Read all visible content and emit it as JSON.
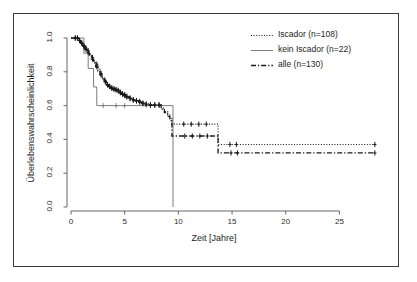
{
  "chart_data": {
    "type": "line",
    "title": "",
    "subtitle": "",
    "xlabel": "Zeit [Jahre]",
    "ylabel": "Überlebenswahrscheinlichkeit",
    "xlim": [
      0,
      28.5
    ],
    "ylim": [
      0,
      1.0
    ],
    "xticks": [
      0,
      5,
      10,
      15,
      20,
      25
    ],
    "xtick_labels": [
      "0",
      "5",
      "10",
      "15",
      "20",
      "25"
    ],
    "yticks": [
      0.0,
      0.2,
      0.4,
      0.6,
      0.8,
      1.0
    ],
    "ytick_labels": [
      "0.0",
      "0.2",
      "0.4",
      "0.6",
      "0.8",
      "1.0"
    ],
    "grid": false,
    "legend_position": "top-right",
    "plot_kind": "kaplan-meier-step",
    "series": [
      {
        "name": "Iscador (n=108)",
        "linestyle": "dotted",
        "color": "#1a1a1a",
        "steps": [
          [
            0.0,
            1.0
          ],
          [
            0.5,
            1.0
          ],
          [
            0.7,
            0.985
          ],
          [
            0.9,
            0.97
          ],
          [
            1.1,
            0.955
          ],
          [
            1.3,
            0.94
          ],
          [
            1.5,
            0.925
          ],
          [
            1.7,
            0.905
          ],
          [
            1.9,
            0.885
          ],
          [
            2.1,
            0.865
          ],
          [
            2.3,
            0.845
          ],
          [
            2.5,
            0.815
          ],
          [
            2.7,
            0.79
          ],
          [
            2.9,
            0.765
          ],
          [
            3.1,
            0.745
          ],
          [
            3.3,
            0.725
          ],
          [
            3.5,
            0.715
          ],
          [
            3.7,
            0.705
          ],
          [
            3.9,
            0.7
          ],
          [
            4.1,
            0.695
          ],
          [
            4.3,
            0.69
          ],
          [
            4.5,
            0.68
          ],
          [
            4.7,
            0.67
          ],
          [
            4.9,
            0.665
          ],
          [
            5.1,
            0.655
          ],
          [
            5.4,
            0.645
          ],
          [
            5.7,
            0.635
          ],
          [
            6.0,
            0.63
          ],
          [
            6.3,
            0.625
          ],
          [
            6.6,
            0.615
          ],
          [
            6.9,
            0.61
          ],
          [
            7.3,
            0.605
          ],
          [
            7.7,
            0.605
          ],
          [
            8.1,
            0.605
          ],
          [
            8.4,
            0.585
          ],
          [
            8.7,
            0.565
          ],
          [
            9.0,
            0.545
          ],
          [
            9.2,
            0.525
          ],
          [
            9.4,
            0.49
          ],
          [
            13.7,
            0.49
          ],
          [
            13.7,
            0.37
          ],
          [
            28.3,
            0.37
          ]
        ],
        "censor_marks_x": [
          0.4,
          0.6,
          0.8,
          1.0,
          1.2,
          1.4,
          1.6,
          2.0,
          2.4,
          2.8,
          3.2,
          3.4,
          3.6,
          3.8,
          4.0,
          4.2,
          4.4,
          4.6,
          4.8,
          5.0,
          5.2,
          5.5,
          5.8,
          6.1,
          6.4,
          6.7,
          7.0,
          7.4,
          7.8,
          8.2,
          10.5,
          11.2,
          11.9,
          12.6,
          14.8,
          15.4,
          28.3
        ]
      },
      {
        "name": "kein Iscador (n=22)",
        "linestyle": "solid",
        "color": "#6e6e6e",
        "steps": [
          [
            0.0,
            1.0
          ],
          [
            1.2,
            1.0
          ],
          [
            1.2,
            0.91
          ],
          [
            1.6,
            0.91
          ],
          [
            1.6,
            0.82
          ],
          [
            2.1,
            0.82
          ],
          [
            2.1,
            0.71
          ],
          [
            2.4,
            0.71
          ],
          [
            2.4,
            0.6
          ],
          [
            9.5,
            0.6
          ],
          [
            9.5,
            0.0
          ]
        ],
        "censor_marks_x": [
          3.0,
          4.2,
          5.0
        ]
      },
      {
        "name": "alle (n=130)",
        "linestyle": "dashdot",
        "color": "#1a1a1a",
        "steps": [
          [
            0.0,
            1.0
          ],
          [
            0.5,
            1.0
          ],
          [
            0.7,
            0.985
          ],
          [
            0.9,
            0.968
          ],
          [
            1.1,
            0.95
          ],
          [
            1.3,
            0.932
          ],
          [
            1.5,
            0.915
          ],
          [
            1.7,
            0.895
          ],
          [
            1.9,
            0.875
          ],
          [
            2.1,
            0.852
          ],
          [
            2.3,
            0.83
          ],
          [
            2.5,
            0.805
          ],
          [
            2.7,
            0.782
          ],
          [
            2.9,
            0.758
          ],
          [
            3.1,
            0.74
          ],
          [
            3.3,
            0.722
          ],
          [
            3.5,
            0.712
          ],
          [
            3.7,
            0.702
          ],
          [
            3.9,
            0.697
          ],
          [
            4.1,
            0.692
          ],
          [
            4.3,
            0.686
          ],
          [
            4.5,
            0.676
          ],
          [
            4.7,
            0.667
          ],
          [
            4.9,
            0.66
          ],
          [
            5.1,
            0.651
          ],
          [
            5.4,
            0.641
          ],
          [
            5.7,
            0.632
          ],
          [
            6.0,
            0.627
          ],
          [
            6.3,
            0.62
          ],
          [
            6.6,
            0.612
          ],
          [
            6.9,
            0.606
          ],
          [
            7.3,
            0.602
          ],
          [
            7.7,
            0.602
          ],
          [
            8.1,
            0.602
          ],
          [
            8.4,
            0.58
          ],
          [
            8.7,
            0.558
          ],
          [
            9.0,
            0.536
          ],
          [
            9.2,
            0.512
          ],
          [
            9.4,
            0.42
          ],
          [
            13.7,
            0.42
          ],
          [
            13.7,
            0.32
          ],
          [
            28.3,
            0.32
          ]
        ],
        "censor_marks_x": [
          0.4,
          0.6,
          0.8,
          1.0,
          1.2,
          1.4,
          1.6,
          2.0,
          2.4,
          2.8,
          3.2,
          3.4,
          3.6,
          3.8,
          4.0,
          4.2,
          4.4,
          4.6,
          4.8,
          5.0,
          5.2,
          5.5,
          5.8,
          6.1,
          6.4,
          6.7,
          7.0,
          7.4,
          7.8,
          8.2,
          10.6,
          11.3,
          12.0,
          12.7,
          14.9,
          15.5,
          28.3
        ]
      }
    ]
  },
  "legend": {
    "items": [
      {
        "label": "Iscador (n=108)",
        "style": "dotted"
      },
      {
        "label": "kein Iscador (n=22)",
        "style": "solid"
      },
      {
        "label": "alle (n=130)",
        "style": "dashdot"
      }
    ]
  },
  "axes": {
    "x_title": "Zeit [Jahre]",
    "y_title": "Überlebenswahrscheinlichkeit",
    "x_tick_labels": [
      "0",
      "5",
      "10",
      "15",
      "20",
      "25"
    ],
    "y_tick_labels": [
      "0.0",
      "0.2",
      "0.4",
      "0.6",
      "0.8",
      "1.0"
    ]
  },
  "colors": {
    "frame": "#3a3a3a",
    "axis": "#555555",
    "curve_primary": "#1a1a1a",
    "curve_secondary": "#6e6e6e",
    "background": "#ffffff"
  }
}
